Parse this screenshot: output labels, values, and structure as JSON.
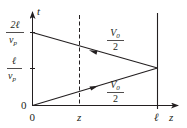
{
  "diagram": {
    "type": "space-time bounce diagram",
    "axes": {
      "vertical_label": "t",
      "horizontal_label": "z",
      "origin_t_label": "0",
      "origin_z_label": "0"
    },
    "t_ticks": [
      {
        "numerator": "ℓ",
        "denominator": "v",
        "denominator_sub": "p",
        "meaning": "ℓ/v_p"
      },
      {
        "numerator": "2ℓ",
        "denominator": "v",
        "denominator_sub": "p",
        "meaning": "2ℓ/v_p"
      }
    ],
    "z_ticks": [
      {
        "label": "z",
        "style": "dashed"
      },
      {
        "label": "ℓ",
        "style": "solid"
      }
    ],
    "waves": [
      {
        "name": "incident",
        "numerator": "V",
        "numerator_sub": "0",
        "denominator": "2",
        "direction": "+z",
        "from": "(0, 0)",
        "to": "(ℓ, ℓ/v_p)"
      },
      {
        "name": "reflected",
        "numerator": "V",
        "numerator_sub": "0",
        "denominator": "2",
        "direction": "-z",
        "from": "(ℓ, ℓ/v_p)",
        "to": "(0, 2ℓ/v_p)"
      }
    ],
    "colors": {
      "ink": "#231f20",
      "background": "#ffffff"
    }
  }
}
